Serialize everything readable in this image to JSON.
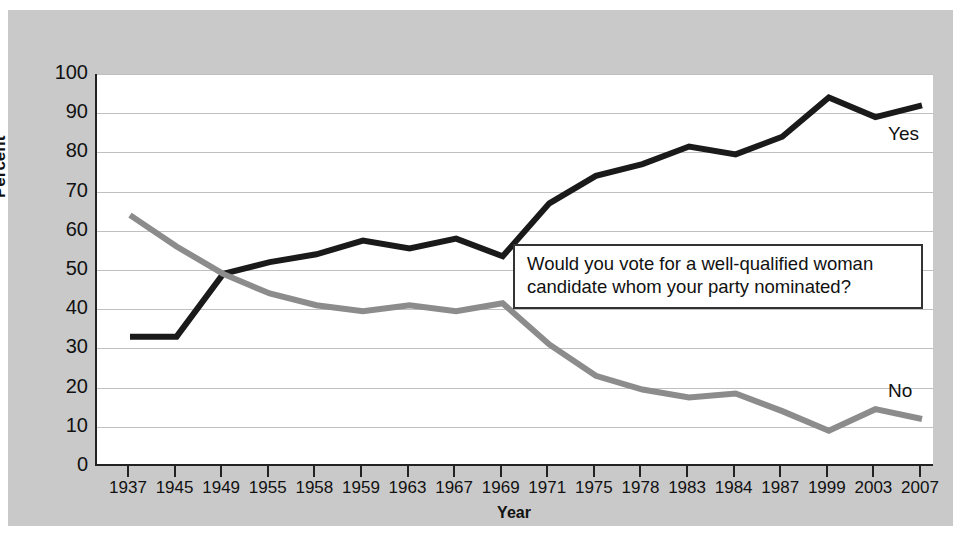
{
  "chart_data": {
    "type": "line",
    "title": "",
    "xlabel": "Year",
    "ylabel": "Percent",
    "ylim": [
      0,
      100
    ],
    "y_ticks": [
      0,
      10,
      20,
      30,
      40,
      50,
      60,
      70,
      80,
      90,
      100
    ],
    "grid": true,
    "legend_position": "inline-right-end",
    "categories": [
      "1937",
      "1945",
      "1949",
      "1955",
      "1958",
      "1959",
      "1963",
      "1967",
      "1969",
      "1971",
      "1975",
      "1978",
      "1983",
      "1984",
      "1987",
      "1999",
      "2003",
      "2007"
    ],
    "annotations": [
      "Would you vote for a well-qualified woman candidate whom your party nominated?"
    ],
    "series": [
      {
        "name": "Yes",
        "color": "#1a1a1a",
        "values": [
          33,
          33,
          49,
          52,
          54,
          57.5,
          55.5,
          58,
          53.5,
          67,
          74,
          77,
          81.5,
          79.5,
          84,
          94,
          89,
          92
        ]
      },
      {
        "name": "No",
        "color": "#8c8c8c",
        "values": [
          64,
          56,
          49,
          44,
          41,
          39.5,
          41,
          39.5,
          41.5,
          31,
          23,
          19.5,
          17.5,
          18.5,
          14,
          9,
          14.5,
          12
        ]
      }
    ]
  },
  "axes": {
    "y_title": "Percent",
    "x_title": "Year"
  },
  "callout": {
    "text": "Would you vote for a well-qualified woman candidate whom your party nominated?"
  },
  "labels": {
    "yes": "Yes",
    "no": "No"
  },
  "colors": {
    "background": "#c9c9c9",
    "plot_background": "#ffffff",
    "axis": "#222222",
    "gridline": "#c0c0c0",
    "series_yes": "#1a1a1a",
    "series_no": "#8c8c8c"
  }
}
